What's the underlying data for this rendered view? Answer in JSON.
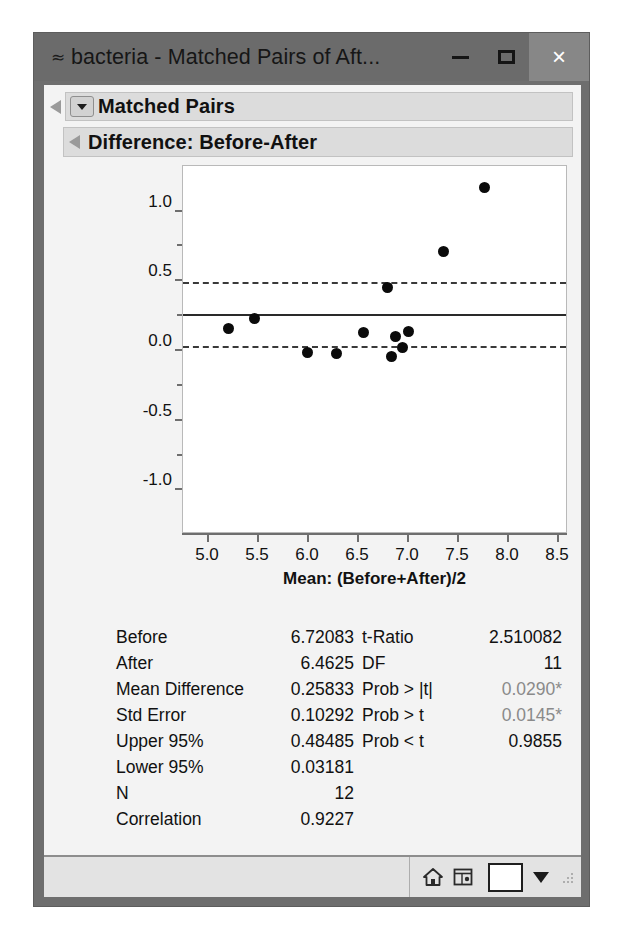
{
  "window": {
    "title": "bacteria - Matched Pairs of Aft...",
    "sys_icon": "jmp-icon",
    "minimize_label": "—",
    "maximize_label": "□",
    "close_label": "×"
  },
  "outline": {
    "section1_title": "Matched Pairs",
    "section2_title": "Difference: Before-After"
  },
  "chart_data": {
    "type": "scatter",
    "title": "",
    "xlabel": "Mean: (Before+After)/2",
    "ylabel": "Difference: Before-After",
    "xlim": [
      4.75,
      8.6
    ],
    "ylim": [
      -1.32,
      1.32
    ],
    "xticks": [
      "5.0",
      "5.5",
      "6.0",
      "6.5",
      "7.0",
      "7.5",
      "8.0",
      "8.5"
    ],
    "xtick_values": [
      5.0,
      5.5,
      6.0,
      6.5,
      7.0,
      7.5,
      8.0,
      8.5
    ],
    "yticks": [
      "1.0",
      "0.5",
      "0.0",
      "-0.5",
      "-1.0"
    ],
    "ytick_values": [
      1.0,
      0.5,
      0.0,
      -0.5,
      -1.0
    ],
    "grid": false,
    "legend": "none",
    "point_color": "#0b0b0b",
    "x": [
      5.2,
      5.46,
      5.99,
      6.28,
      6.55,
      6.79,
      6.83,
      6.87,
      6.94,
      7.0,
      7.35,
      7.76
    ],
    "y": [
      0.155,
      0.225,
      -0.015,
      -0.025,
      0.125,
      0.445,
      -0.05,
      0.095,
      0.02,
      0.135,
      0.705,
      1.165
    ],
    "reference_lines": [
      {
        "name": "upper-95-line",
        "value": 0.48485,
        "style": "dashed"
      },
      {
        "name": "mean-difference-line",
        "value": 0.25833,
        "style": "solid"
      },
      {
        "name": "lower-95-line",
        "value": 0.03181,
        "style": "dashed"
      }
    ]
  },
  "stats": {
    "rows": [
      {
        "label": "Before",
        "value": "6.72083",
        "label2": "t-Ratio",
        "value2": "2.510082",
        "grey2": false
      },
      {
        "label": "After",
        "value": "6.4625",
        "label2": "DF",
        "value2": "11",
        "grey2": false
      },
      {
        "label": "Mean Difference",
        "value": "0.25833",
        "label2": "Prob > |t|",
        "value2": "0.0290*",
        "grey2": true
      },
      {
        "label": "Std Error",
        "value": "0.10292",
        "label2": "Prob > t",
        "value2": "0.0145*",
        "grey2": true
      },
      {
        "label": "Upper 95%",
        "value": "0.48485",
        "label2": "Prob < t",
        "value2": "0.9855",
        "grey2": false
      },
      {
        "label": "Lower 95%",
        "value": "0.03181",
        "label2": "",
        "value2": "",
        "grey2": false
      },
      {
        "label": "N",
        "value": "12",
        "label2": "",
        "value2": "",
        "grey2": false
      },
      {
        "label": "Correlation",
        "value": "0.9227",
        "label2": "",
        "value2": "",
        "grey2": false
      }
    ]
  },
  "statusbar": {
    "home_icon": "home-icon",
    "report_icon": "report-window-icon",
    "color_swatch": "#ffffff",
    "caret": "▼"
  }
}
